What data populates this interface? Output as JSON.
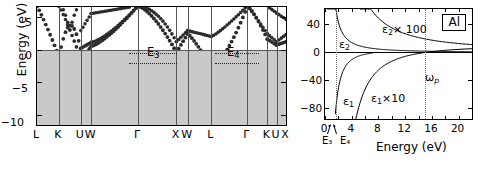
{
  "figure": {
    "panels": [
      "band-structure",
      "dielectric-function"
    ],
    "material": "Al"
  },
  "left_panel": {
    "y_axis_title": "Energy (eV)",
    "y_ticks": [
      "5",
      "0",
      "−5",
      "−10"
    ],
    "y_tick_values": [
      5,
      0,
      -5,
      -10
    ],
    "ylim": [
      -11.5,
      6.5
    ],
    "x_tick_labels": [
      "L",
      "K",
      "U",
      "W",
      "Γ",
      "X",
      "W",
      "L",
      "Γ",
      "K",
      "U",
      "X"
    ],
    "fermi_level": 0,
    "annotations": [
      {
        "label": "E",
        "sub": "3",
        "text": "E₃"
      },
      {
        "label": "E",
        "sub": "4",
        "text": "E₄"
      }
    ],
    "shading_color": "#c9c9c9",
    "band_color": "#2b2b2b"
  },
  "right_panel": {
    "box_label": "Al",
    "x_axis_title": "Energy (eV)",
    "x_ticks": [
      "0",
      "4",
      "8",
      "12",
      "16",
      "20"
    ],
    "x_tick_values": [
      0,
      4,
      8,
      12,
      16,
      20
    ],
    "xlim": [
      0,
      22
    ],
    "y_ticks": [
      "40",
      "0",
      "−40",
      "−80"
    ],
    "y_tick_values": [
      40,
      0,
      -40,
      -80
    ],
    "ylim": [
      -95,
      62
    ],
    "curve_labels": [
      {
        "name": "eps2",
        "text": "ε",
        "sub": "2"
      },
      {
        "name": "eps2x100",
        "text": "ε",
        "sub": "2",
        "suffix": "× 100"
      },
      {
        "name": "eps1",
        "text": "ε",
        "sub": "1"
      },
      {
        "name": "eps1x10",
        "text": "ε",
        "sub": "1",
        "suffix": "×10"
      },
      {
        "name": "omega-p",
        "text": "ω",
        "sub": "p"
      }
    ],
    "marker_labels": [
      "E₃",
      "E₄"
    ],
    "plasma_frequency_ev": 15,
    "e3_ev": 1.6,
    "e4_ev": 2.4
  },
  "chart_data": {
    "type": "line",
    "title": "",
    "charts": [
      {
        "name": "band-structure",
        "type": "line",
        "xlabel": "",
        "ylabel": "Energy (eV)",
        "ylim": [
          -11.5,
          6.5
        ],
        "xticklabels": [
          "L",
          "K",
          "U",
          "W",
          "Γ",
          "X",
          "W",
          "L",
          "Γ",
          "K",
          "U",
          "X"
        ],
        "yticks": [
          5,
          0,
          -5,
          -10
        ],
        "grid": false,
        "legend": "none",
        "annotations": [
          "E₃",
          "E₄"
        ],
        "series": [
          {
            "name": "band-1-valence",
            "note": "free-electron-like parabola, min −10.6 eV at Γ"
          },
          {
            "name": "band-2",
            "note": "upper band crossing E_F"
          },
          {
            "name": "band-3",
            "note": "upper band crossing E_F"
          }
        ]
      },
      {
        "name": "dielectric-function",
        "type": "line",
        "xlabel": "Energy (eV)",
        "ylabel": "",
        "xlim": [
          0,
          22
        ],
        "ylim": [
          -95,
          62
        ],
        "xticks": [
          0,
          4,
          8,
          12,
          16,
          20
        ],
        "yticks": [
          40,
          0,
          -40,
          -80
        ],
        "grid": false,
        "legend": "inline-labels",
        "series": [
          {
            "name": "ε₂",
            "note": "peaks ~40 near 1.6 eV then decays toward 0"
          },
          {
            "name": "ε₂×100",
            "note": "decays from ~60 at 6 eV toward ~4 at 22 eV"
          },
          {
            "name": "ε₁",
            "note": "rises from −85 at 1.6 eV toward 0 near 6 eV"
          },
          {
            "name": "ε₁×10",
            "note": "rises from −90 at 5 eV, crosses 0 near 15 eV (ω_p)"
          }
        ],
        "vlines": [
          1.6,
          15.0
        ]
      }
    ]
  }
}
